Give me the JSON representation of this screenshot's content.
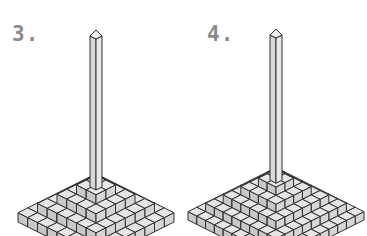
{
  "figures": [
    {
      "label": "3.",
      "label_pos": {
        "x": 12,
        "y": 22
      },
      "center_x": 96,
      "tip_y": 222,
      "tiers": [
        4,
        3,
        2,
        1
      ],
      "column": {
        "top_y": 30,
        "width": 12
      }
    },
    {
      "label": "4.",
      "label_pos": {
        "x": 207,
        "y": 22
      },
      "center_x": 276,
      "tip_y": 220,
      "tiers": [
        5,
        4,
        3,
        2,
        1
      ],
      "column": {
        "top_y": 29,
        "width": 12
      }
    }
  ],
  "style": {
    "top_face": "#e6e6e6",
    "left_face": "#c8c8c8",
    "right_face": "#d6d6d6",
    "edge": "#2e2e2e",
    "label_color": "#8a8a8a"
  }
}
